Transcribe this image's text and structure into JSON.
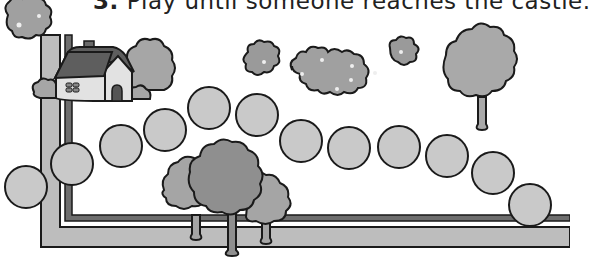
{
  "instruction": {
    "number": "3.",
    "text": "Play until someone reaches the castle."
  },
  "board": {
    "spaces_count": 12,
    "spaces": [
      {
        "id": 1,
        "cx": 26,
        "cy": 187
      },
      {
        "id": 2,
        "cx": 72,
        "cy": 164
      },
      {
        "id": 3,
        "cx": 121,
        "cy": 146
      },
      {
        "id": 4,
        "cx": 165,
        "cy": 130
      },
      {
        "id": 5,
        "cx": 209,
        "cy": 108
      },
      {
        "id": 6,
        "cx": 257,
        "cy": 115
      },
      {
        "id": 7,
        "cx": 301,
        "cy": 141
      },
      {
        "id": 8,
        "cx": 349,
        "cy": 148
      },
      {
        "id": 9,
        "cx": 399,
        "cy": 147
      },
      {
        "id": 10,
        "cx": 447,
        "cy": 156
      },
      {
        "id": 11,
        "cx": 493,
        "cy": 173
      },
      {
        "id": 12,
        "cx": 530,
        "cy": 205
      }
    ],
    "space_radius": 21
  },
  "decorations": [
    "flower-bush-top-left",
    "house",
    "bush-behind-house",
    "flower-bushes-center",
    "tree-right",
    "tree-cluster-bottom",
    "path-border"
  ],
  "colors": {
    "space_fill": "#c9c9c9",
    "outline": "#1a1a1a",
    "light_band": "#bdbdbd",
    "dark_band": "#6e6e6e",
    "foliage": "#a8a8a8",
    "foliage_dark": "#8f8f8f",
    "roof": "#5e5e5e",
    "house_wall": "#e2e2e2"
  }
}
